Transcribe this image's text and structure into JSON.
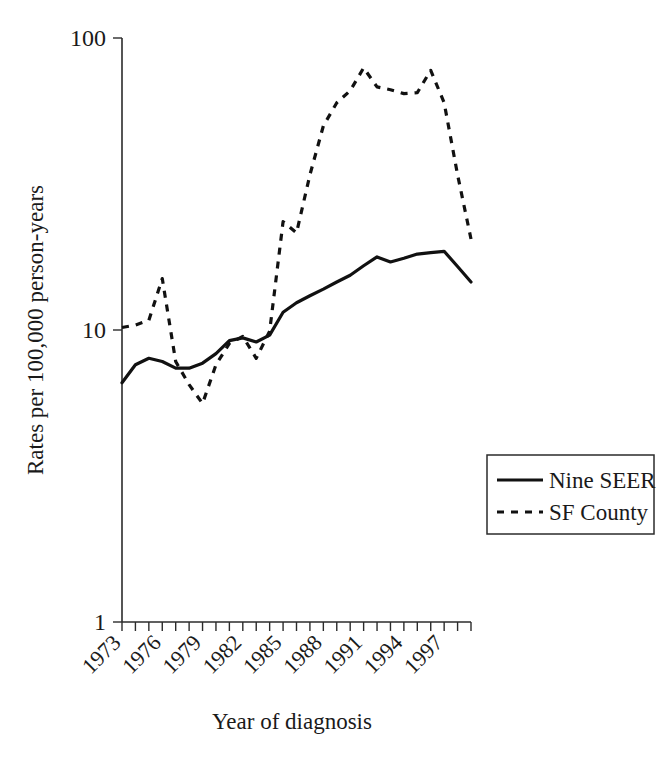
{
  "chart_data": {
    "type": "line",
    "title": "",
    "xlabel": "Year of diagnosis",
    "ylabel": "Rates per 100,000 person-years",
    "yscale": "log",
    "ylim": [
      1,
      100
    ],
    "ytick_labels": [
      "100",
      "10",
      "1"
    ],
    "ytick_values": [
      100,
      10,
      1
    ],
    "xlim": [
      1973,
      1999
    ],
    "xtick_labels": [
      "1973",
      "1976",
      "1979",
      "1982",
      "1985",
      "1988",
      "1991",
      "1994",
      "1997"
    ],
    "xtick_values": [
      1973,
      1976,
      1979,
      1982,
      1985,
      1988,
      1991,
      1994,
      1997
    ],
    "xtick_rotation": 45,
    "grid": false,
    "legend_position": "center-right",
    "x": [
      1973,
      1974,
      1975,
      1976,
      1977,
      1978,
      1979,
      1980,
      1981,
      1982,
      1983,
      1984,
      1985,
      1986,
      1987,
      1988,
      1989,
      1990,
      1991,
      1992,
      1993,
      1994,
      1995,
      1996,
      1997,
      1998,
      1999
    ],
    "series": [
      {
        "name": "Nine SEER",
        "style": "solid",
        "values": [
          6.6,
          7.6,
          8.0,
          7.8,
          7.4,
          7.4,
          7.7,
          8.3,
          9.2,
          9.4,
          9.1,
          9.6,
          11.5,
          12.4,
          13.1,
          13.8,
          14.6,
          15.4,
          16.6,
          17.8,
          17.1,
          17.6,
          18.2,
          18.4,
          18.6,
          16.5,
          14.6
        ]
      },
      {
        "name": "SF County",
        "style": "dashed",
        "values": [
          10.2,
          10.4,
          10.8,
          15.0,
          7.8,
          6.5,
          5.6,
          7.6,
          9.0,
          9.5,
          8.0,
          9.9,
          23.5,
          21.5,
          34.0,
          50.0,
          60.0,
          66.0,
          79.0,
          68.0,
          66.5,
          64.5,
          65.0,
          77.5,
          60.0,
          34.0,
          20.5
        ]
      }
    ]
  },
  "legend": {
    "items": [
      {
        "label": "Nine SEER",
        "style": "solid"
      },
      {
        "label": "SF County",
        "style": "dashed"
      }
    ]
  },
  "axes": {
    "y_label": "Rates per 100,000 person-years",
    "x_label": "Year of diagnosis",
    "y_ticks": [
      "100",
      "10",
      "1"
    ],
    "x_ticks": [
      "1973",
      "1976",
      "1979",
      "1982",
      "1985",
      "1988",
      "1991",
      "1994",
      "1997"
    ]
  }
}
